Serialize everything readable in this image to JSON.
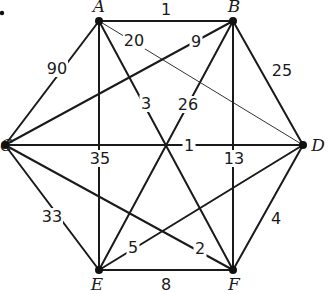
{
  "figure": {
    "marker": "•",
    "vertices": [
      {
        "id": "A",
        "label": "A",
        "x": 99,
        "y": 21,
        "lx": 99,
        "ly": 12,
        "anchor": "middle"
      },
      {
        "id": "B",
        "label": "B",
        "x": 233,
        "y": 21,
        "lx": 234,
        "ly": 12,
        "anchor": "middle"
      },
      {
        "id": "C",
        "label": "C",
        "x": 5,
        "y": 145,
        "lx": -3,
        "ly": 151,
        "anchor": "middle"
      },
      {
        "id": "D",
        "label": "D",
        "x": 303,
        "y": 145,
        "lx": 318,
        "ly": 151,
        "anchor": "middle"
      },
      {
        "id": "E",
        "label": "E",
        "x": 99,
        "y": 270,
        "lx": 97,
        "ly": 290,
        "anchor": "middle"
      },
      {
        "id": "F",
        "label": "F",
        "x": 233,
        "y": 270,
        "lx": 234,
        "ly": 290,
        "anchor": "middle"
      }
    ],
    "edges": [
      {
        "from": "A",
        "to": "B",
        "weight": "1",
        "lx": 166,
        "ly": 15,
        "thin": false
      },
      {
        "from": "A",
        "to": "C",
        "weight": "90",
        "lx": 57,
        "ly": 74,
        "thin": false
      },
      {
        "from": "A",
        "to": "D",
        "weight": "20",
        "lx": 134,
        "ly": 46,
        "thin": true
      },
      {
        "from": "A",
        "to": "E",
        "weight": "35",
        "lx": 100,
        "ly": 164,
        "thin": false
      },
      {
        "from": "A",
        "to": "F",
        "weight": "3",
        "lx": 146,
        "ly": 109,
        "thin": false
      },
      {
        "from": "B",
        "to": "C",
        "weight": "9",
        "lx": 196,
        "ly": 47,
        "thin": false
      },
      {
        "from": "B",
        "to": "D",
        "weight": "25",
        "lx": 282,
        "ly": 76,
        "thin": false
      },
      {
        "from": "B",
        "to": "E",
        "weight": "26",
        "lx": 188,
        "ly": 110,
        "thin": false
      },
      {
        "from": "B",
        "to": "F",
        "weight": "13",
        "lx": 234,
        "ly": 164,
        "thin": false
      },
      {
        "from": "C",
        "to": "D",
        "weight": "1",
        "lx": 189,
        "ly": 151,
        "thin": false
      },
      {
        "from": "C",
        "to": "E",
        "weight": "33",
        "lx": 52,
        "ly": 222,
        "thin": false
      },
      {
        "from": "C",
        "to": "F",
        "weight": "2",
        "lx": 200,
        "ly": 254,
        "thin": false
      },
      {
        "from": "D",
        "to": "E",
        "weight": "5",
        "lx": 133,
        "ly": 253,
        "thin": false
      },
      {
        "from": "D",
        "to": "F",
        "weight": "4",
        "lx": 276,
        "ly": 224,
        "thin": false
      },
      {
        "from": "E",
        "to": "F",
        "weight": "8",
        "lx": 166,
        "ly": 290,
        "thin": false
      }
    ]
  }
}
